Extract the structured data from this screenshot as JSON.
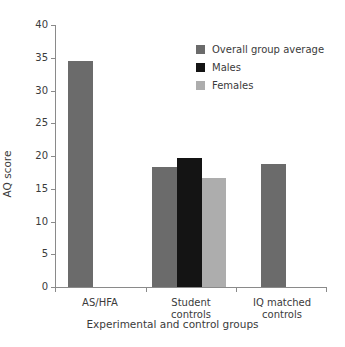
{
  "chart_data": {
    "type": "bar",
    "title": "",
    "xlabel": "Experimental and control groups",
    "ylabel": "AQ score",
    "ylim": [
      0,
      40
    ],
    "yticks": [
      0,
      5,
      10,
      15,
      20,
      25,
      30,
      35,
      40
    ],
    "ytick_labels": [
      "0",
      "5",
      "10",
      "15",
      "20",
      "25",
      "30",
      "35",
      "40"
    ],
    "grid": false,
    "legend_position": "top-right",
    "categories": [
      "AS/HFA",
      "Student controls",
      "IQ matched controls"
    ],
    "category_lines": [
      [
        "AS/HFA"
      ],
      [
        "Student",
        "controls"
      ],
      [
        "IQ matched",
        "controls"
      ]
    ],
    "series": [
      {
        "name": "Overall group average",
        "color": "#6b6b6b",
        "values": [
          34.5,
          18.3,
          18.8
        ]
      },
      {
        "name": "Males",
        "color": "#141414",
        "values": [
          null,
          19.7,
          null
        ]
      },
      {
        "name": "Females",
        "color": "#adadad",
        "values": [
          null,
          16.6,
          null
        ]
      }
    ],
    "bars": [
      {
        "label": "AS/HFA overall group average",
        "series": "Overall group average",
        "category": "AS/HFA",
        "value": 34.5,
        "color": "#6b6b6b",
        "x": 13,
        "width": 25
      },
      {
        "label": "Student controls overall group average",
        "series": "Overall group average",
        "category": "Student controls",
        "value": 18.3,
        "color": "#6b6b6b",
        "x": 97,
        "width": 25
      },
      {
        "label": "Student controls males",
        "series": "Males",
        "category": "Student controls",
        "value": 19.7,
        "color": "#141414",
        "x": 122,
        "width": 25
      },
      {
        "label": "Student controls females",
        "series": "Females",
        "category": "Student controls",
        "value": 16.6,
        "color": "#adadad",
        "x": 147,
        "width": 24
      },
      {
        "label": "IQ matched controls overall group average",
        "series": "Overall group average",
        "category": "IQ matched controls",
        "value": 18.8,
        "color": "#6b6b6b",
        "x": 206,
        "width": 25
      }
    ],
    "category_tick_positions": [
      0,
      90.6,
      181.3,
      272
    ],
    "category_label_centers": [
      45,
      136,
      227
    ]
  },
  "legend": {
    "items": [
      {
        "label": "Overall group average",
        "color": "#6b6b6b"
      },
      {
        "label": "Males",
        "color": "#141414"
      },
      {
        "label": "Females",
        "color": "#adadad"
      }
    ]
  },
  "axes": {
    "y_title": "AQ score",
    "x_title": "Experimental and control groups"
  }
}
